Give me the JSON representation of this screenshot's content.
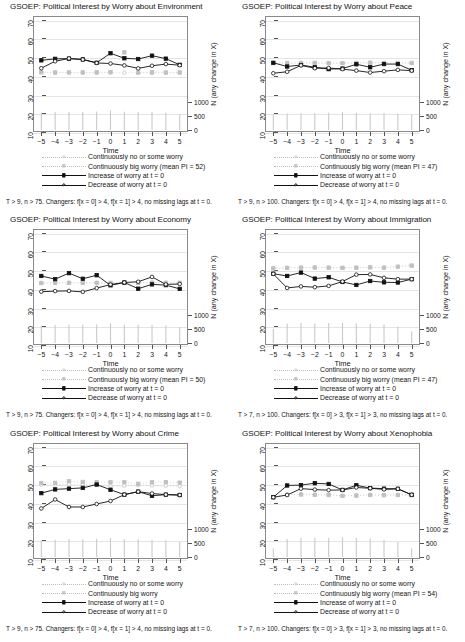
{
  "figure": {
    "panel_width": 232,
    "panel_height": 214,
    "axis": {
      "y_ticks": [
        70,
        60,
        50,
        40,
        30,
        20,
        10
      ],
      "y_min": 10,
      "y_max": 72,
      "x_ticks": [
        "−5",
        "−4",
        "−3",
        "−2",
        "−1",
        "0",
        "1",
        "2",
        "3",
        "4",
        "5"
      ],
      "x_label": "Time",
      "right_ticks": [
        "1000",
        "500",
        "0"
      ],
      "right_label": "N (any change in X)"
    },
    "legend_labels": {
      "cont_none": "Continuously no or some worry",
      "cont_big": "Continuously big worry",
      "increase": "Increase of worry at t = 0",
      "decrease": "Decrease of worry at t = 0"
    }
  },
  "chart_data": [
    {
      "type": "line",
      "title": "GSOEP: Political Interest by Worry about Environment",
      "xlabel": "Time",
      "ylabel": "",
      "ylim": [
        10,
        72
      ],
      "x": [
        -5,
        -4,
        -3,
        -2,
        -1,
        0,
        1,
        2,
        3,
        4,
        5
      ],
      "grid": true,
      "legend_position": "below",
      "legend_big_worry": "Continuously big worry (mean PI = 52)",
      "mean_pi": 52,
      "note": "T > 9, n > 75. Changers: f[x = 0] > 4, f[x = 1] > 4, no missing lags at t = 0.",
      "series": [
        {
          "name": "Continuously no or some worry",
          "values": [
            42.0,
            41.8,
            41.9,
            41.9,
            41.6,
            41.7,
            41.7,
            41.6,
            41.6,
            41.7,
            41.8
          ]
        },
        {
          "name": "Continuously big worry (mean PI = 52)",
          "values": [
            41.9,
            41.8,
            41.8,
            41.8,
            41.9,
            42.0,
            52.6,
            41.8,
            41.9,
            41.8,
            41.8
          ]
        },
        {
          "name": "Increase of worry at t = 0",
          "values": [
            48.3,
            49.1,
            49.2,
            48.8,
            47.0,
            52.1,
            49.4,
            49.0,
            50.8,
            49.2,
            45.9
          ]
        },
        {
          "name": "Decrease of worry at t = 0",
          "values": [
            44.1,
            47.8,
            49.3,
            48.7,
            46.9,
            46.6,
            45.6,
            44.0,
            45.4,
            46.3,
            45.7
          ]
        }
      ],
      "spikes": [
        620,
        640,
        650,
        640,
        660,
        700,
        650,
        640,
        640,
        620,
        560
      ]
    },
    {
      "type": "line",
      "title": "GSOEP: Political Interest by Worry about Peace",
      "xlabel": "Time",
      "ylabel": "",
      "ylim": [
        10,
        72
      ],
      "x": [
        -5,
        -4,
        -3,
        -2,
        -1,
        0,
        1,
        2,
        3,
        4,
        5
      ],
      "grid": true,
      "legend_position": "below",
      "legend_big_worry": "Continuously big worry (mean PI = 47)",
      "mean_pi": 47,
      "note": "T > 9, n > 100. Changers: f[x = 0] > 4, f[x = 1] > 4, no missing lags at t = 0.",
      "series": [
        {
          "name": "Continuously no or some worry",
          "values": [
            46.9,
            46.8,
            46.9,
            46.9,
            46.8,
            46.8,
            46.9,
            47.0,
            46.9,
            46.9,
            46.9
          ]
        },
        {
          "name": "Continuously big worry (mean PI = 47)",
          "values": [
            46.8,
            46.8,
            46.9,
            46.9,
            46.8,
            46.8,
            46.9,
            47.0,
            46.9,
            46.9,
            46.9
          ]
        },
        {
          "name": "Increase of worry at t = 0",
          "values": [
            47.0,
            45.0,
            45.8,
            44.6,
            43.6,
            43.9,
            46.2,
            44.6,
            46.3,
            46.3,
            43.0
          ]
        },
        {
          "name": "Decrease of worry at t = 0",
          "values": [
            41.4,
            42.2,
            45.6,
            44.1,
            44.2,
            43.6,
            42.8,
            41.8,
            42.5,
            43.2,
            42.8
          ]
        }
      ],
      "spikes": [
        560,
        590,
        600,
        600,
        620,
        640,
        610,
        600,
        600,
        580,
        540
      ]
    },
    {
      "type": "line",
      "title": "GSOEP: Political Interest by Worry about Economy",
      "xlabel": "Time",
      "ylabel": "",
      "ylim": [
        10,
        72
      ],
      "x": [
        -5,
        -4,
        -3,
        -2,
        -1,
        0,
        1,
        2,
        3,
        4,
        5
      ],
      "grid": true,
      "legend_position": "below",
      "legend_big_worry": "Continuously big worry (mean PI = 50)",
      "mean_pi": 50,
      "note": "T > 9, n > 75. Changers: f[x = 0] > 4, f[x = 1] > 4, no missing lags at t = 0.",
      "series": [
        {
          "name": "Continuously no or some worry",
          "values": [
            43.2,
            43.2,
            43.3,
            43.3,
            43.2,
            43.2,
            43.3,
            43.3,
            43.3,
            43.3,
            43.3
          ]
        },
        {
          "name": "Continuously big worry (mean PI = 50)",
          "values": [
            43.1,
            43.2,
            43.2,
            43.2,
            43.2,
            43.2,
            43.2,
            43.3,
            43.3,
            43.2,
            43.2
          ]
        },
        {
          "name": "Increase of worry at t = 0",
          "values": [
            46.9,
            45.2,
            48.4,
            45.4,
            47.3,
            41.9,
            43.4,
            40.1,
            42.4,
            42.0,
            40.0
          ]
        },
        {
          "name": "Decrease of worry at t = 0",
          "values": [
            38.5,
            38.8,
            38.9,
            38.4,
            40.4,
            42.3,
            43.4,
            43.8,
            46.4,
            42.4,
            42.6
          ]
        }
      ],
      "spikes": [
        620,
        640,
        660,
        650,
        670,
        700,
        660,
        650,
        640,
        630,
        570
      ]
    },
    {
      "type": "line",
      "title": "GSOEP: Political Interest by Worry about Immigration",
      "xlabel": "Time",
      "ylabel": "",
      "ylim": [
        10,
        72
      ],
      "x": [
        -5,
        -4,
        -3,
        -2,
        -1,
        0,
        1,
        2,
        3,
        4,
        5
      ],
      "grid": true,
      "legend_position": "below",
      "legend_big_worry": "Continuously big worry (mean PI = 47)",
      "mean_pi": 47,
      "note": "T > 7, n > 100. Changers: f[x = 0] > 3, f[x = 1] > 3, no missing lags at t = 0.",
      "series": [
        {
          "name": "Continuously no or some worry",
          "values": [
            51.0,
            51.3,
            51.4,
            51.5,
            51.4,
            51.3,
            51.4,
            51.6,
            51.4,
            52.0,
            52.6
          ]
        },
        {
          "name": "Continuously big worry (mean PI = 47)",
          "values": [
            50.9,
            51.2,
            51.3,
            51.4,
            51.3,
            51.2,
            51.3,
            51.5,
            51.3,
            51.8,
            52.4
          ]
        },
        {
          "name": "Increase of worry at t = 0",
          "values": [
            48.1,
            46.9,
            48.7,
            45.5,
            46.2,
            43.7,
            42.1,
            44.2,
            43.5,
            43.4,
            45.2
          ]
        },
        {
          "name": "Decrease of worry at t = 0",
          "values": [
            48.0,
            40.5,
            41.3,
            40.9,
            41.6,
            43.9,
            47.6,
            47.7,
            45.9,
            45.2,
            45.2
          ]
        }
      ],
      "spikes": [
        500,
        700,
        720,
        700,
        710,
        720,
        700,
        690,
        660,
        580,
        420
      ]
    },
    {
      "type": "line",
      "title": "GSOEP: Political Interest by Worry about Crime",
      "xlabel": "Time",
      "ylabel": "",
      "ylim": [
        10,
        72
      ],
      "x": [
        -5,
        -4,
        -3,
        -2,
        -1,
        0,
        1,
        2,
        3,
        4,
        5
      ],
      "grid": true,
      "legend_position": "below",
      "legend_big_worry": "Continuously big worry",
      "mean_pi": null,
      "note": "T > 9, n > 75. Changers: f[x = 0] > 4, f[x = 1] > 4, no missing lags at t = 0.",
      "series": [
        {
          "name": "Continuously no or some worry",
          "values": [
            49.6,
            49.8,
            49.9,
            50.0,
            49.8,
            48.9,
            49.2,
            49.5,
            49.3,
            49.2,
            49.0
          ]
        },
        {
          "name": "Continuously big worry",
          "values": [
            50.6,
            50.7,
            51.6,
            51.2,
            51.1,
            51.0,
            51.1,
            50.2,
            51.0,
            51.1,
            50.8
          ]
        },
        {
          "name": "Increase of worry at t = 0",
          "values": [
            45.2,
            47.2,
            47.6,
            48.0,
            49.8,
            47.0,
            44.4,
            46.0,
            43.8,
            44.4,
            44.2
          ]
        },
        {
          "name": "Decrease of worry at t = 0",
          "values": [
            37.0,
            41.8,
            37.8,
            37.8,
            39.4,
            41.0,
            44.4,
            46.0,
            45.0,
            44.4,
            44.2
          ]
        }
      ],
      "spikes": [
        600,
        620,
        640,
        630,
        650,
        680,
        640,
        630,
        620,
        600,
        540
      ]
    },
    {
      "type": "line",
      "title": "GSOEP: Political Interest by Worry about Xenophobia",
      "xlabel": "Time",
      "ylabel": "",
      "ylim": [
        10,
        72
      ],
      "x": [
        -5,
        -4,
        -3,
        -2,
        -1,
        0,
        1,
        2,
        3,
        4,
        5
      ],
      "grid": true,
      "legend_position": "below",
      "legend_big_worry": "Continuously big worry (mean PI = 54)",
      "mean_pi": 54,
      "note": "T > 7, n > 100. Changers: f[x = 0] > 3, f[x = 1] > 3, no missing lags at t = 0.",
      "series": [
        {
          "name": "Continuously no or some worry",
          "values": [
            43.2,
            44.4,
            44.6,
            44.4,
            44.3,
            43.8,
            44.0,
            44.3,
            44.2,
            44.3,
            44.3
          ]
        },
        {
          "name": "Continuously big worry (mean PI = 54)",
          "values": [
            43.1,
            44.3,
            44.5,
            44.3,
            44.2,
            43.7,
            43.9,
            44.2,
            44.1,
            44.2,
            44.2
          ]
        },
        {
          "name": "Increase of worry at t = 0",
          "values": [
            43.0,
            49.3,
            49.5,
            50.5,
            50.1,
            46.9,
            49.4,
            47.9,
            47.6,
            47.5,
            44.3
          ]
        },
        {
          "name": "Decrease of worry at t = 0",
          "values": [
            43.0,
            44.2,
            47.6,
            47.1,
            46.8,
            46.9,
            48.2,
            47.8,
            47.2,
            47.5,
            44.3
          ]
        }
      ],
      "spikes": [
        300,
        640,
        680,
        680,
        690,
        700,
        680,
        660,
        620,
        540,
        300
      ]
    }
  ]
}
